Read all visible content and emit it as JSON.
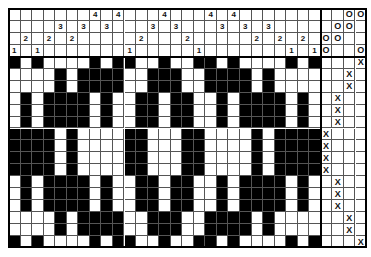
{
  "draft": {
    "columns": 27,
    "shafts": 4,
    "treadles": 4,
    "colors": {
      "filled": "#000000",
      "empty": "#ffffff",
      "grid": "#555555"
    },
    "threading": [
      1,
      2,
      1,
      2,
      3,
      2,
      3,
      4,
      3,
      4,
      1,
      2,
      3,
      4,
      3,
      2,
      1,
      4,
      3,
      4,
      3,
      2,
      3,
      2,
      1,
      2,
      1
    ],
    "threading_row_order": [
      4,
      3,
      2,
      1
    ],
    "tieup_mark": "O",
    "tieup": [
      {
        "shaft": 4,
        "cells": [
          "",
          "",
          "O",
          "O"
        ]
      },
      {
        "shaft": 3,
        "cells": [
          "",
          "O",
          "O",
          ""
        ]
      },
      {
        "shaft": 2,
        "cells": [
          "O",
          "O",
          "",
          ""
        ]
      },
      {
        "shaft": 1,
        "cells": [
          "O",
          "",
          "",
          "O"
        ]
      }
    ],
    "treadling_mark": "X",
    "treadling": [
      3,
      2,
      2,
      1,
      1,
      1,
      0,
      0,
      0,
      0,
      1,
      1,
      1,
      2,
      2,
      3
    ],
    "drawdown": [
      "101000010110010011010000101",
      "000010111100111001111010000",
      "000010111100111001111010000",
      "010111101001101100101111010",
      "010111101001101100101111010",
      "010111101001101100101111010",
      "111101000011000110000101111",
      "111101000011000110000101111",
      "111101000011000110000101111",
      "111101000011000110000101111",
      "010111101001101100101111010",
      "010111101001101100101111010",
      "010111101001101100101111010",
      "000010111100111001111010000",
      "000010111100111001111010000",
      "101000010110010011010000101"
    ]
  }
}
